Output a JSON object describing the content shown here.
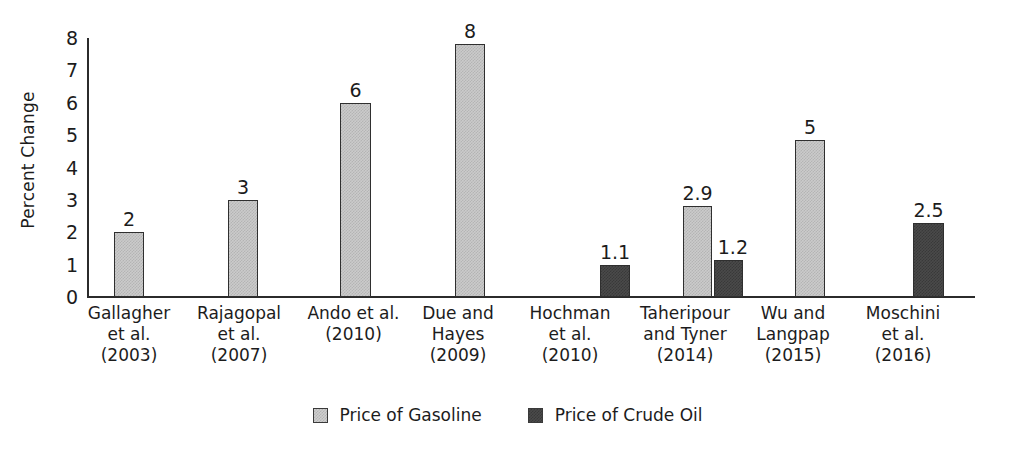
{
  "chart_data": {
    "type": "bar",
    "title": "",
    "xlabel": "",
    "ylabel": "Percent Change",
    "ylim": [
      0,
      8
    ],
    "yticks": [
      0,
      1,
      2,
      3,
      4,
      5,
      6,
      7,
      8
    ],
    "grid": false,
    "legend_position": "bottom-center",
    "categories": [
      "Gallagher et al. (2003)",
      "Rajagopal et al. (2007)",
      "Ando et al. (2010)",
      "Due and Hayes (2009)",
      "Hochman et al. (2010)",
      "Taheripour and Tyner (2014)",
      "Wu and Langpap (2015)",
      "Moschini et al. (2016)"
    ],
    "category_lines": [
      [
        "Gallagher",
        "et al.",
        "(2003)"
      ],
      [
        "Rajagopal",
        "et al.",
        "(2007)"
      ],
      [
        "Ando et al.",
        "(2010)"
      ],
      [
        "Due and",
        "Hayes",
        "(2009)"
      ],
      [
        "Hochman",
        "et al.",
        "(2010)"
      ],
      [
        "Taheripour",
        "and Tyner",
        "(2014)"
      ],
      [
        "Wu and",
        "Langpap",
        "(2015)"
      ],
      [
        "Moschini",
        "et al.",
        "(2016)"
      ]
    ],
    "series": [
      {
        "name": "Price of Gasoline",
        "color": "#cbcbcb",
        "values": [
          2,
          3,
          6,
          8,
          null,
          2.9,
          5,
          null
        ]
      },
      {
        "name": "Price of Crude Oil",
        "color": "#4a4a4a",
        "values": [
          null,
          null,
          null,
          null,
          1.1,
          1.2,
          null,
          2.5
        ]
      }
    ],
    "bars": [
      {
        "category_index": 0,
        "series": "Price of Gasoline",
        "value": 2,
        "label": "2",
        "x": 114,
        "width": 30,
        "label_offset": "center"
      },
      {
        "category_index": 1,
        "series": "Price of Gasoline",
        "value": 3,
        "label": "3",
        "x": 228,
        "width": 30,
        "label_offset": "center"
      },
      {
        "category_index": 2,
        "series": "Price of Gasoline",
        "value": 6,
        "label": "6",
        "x": 340,
        "width": 31,
        "label_offset": "center"
      },
      {
        "category_index": 3,
        "series": "Price of Gasoline",
        "value": 7.8,
        "label": "8",
        "x": 455,
        "width": 30,
        "label_offset": "center"
      },
      {
        "category_index": 4,
        "series": "Price of Crude Oil",
        "value": 1.0,
        "label": "1.1",
        "x": 600,
        "width": 30,
        "label_offset": "center"
      },
      {
        "category_index": 5,
        "series": "Price of Gasoline",
        "value": 2.8,
        "label": "2.9",
        "x": 683,
        "width": 29,
        "label_offset": "center"
      },
      {
        "category_index": 5,
        "series": "Price of Crude Oil",
        "value": 1.15,
        "label": "1.2",
        "x": 714,
        "width": 29,
        "label_offset": "right"
      },
      {
        "category_index": 6,
        "series": "Price of Gasoline",
        "value": 4.85,
        "label": "5",
        "x": 795,
        "width": 30,
        "label_offset": "center"
      },
      {
        "category_index": 7,
        "series": "Price of Crude Oil",
        "value": 2.3,
        "label": "2.5",
        "x": 913,
        "width": 31,
        "label_offset": "center"
      }
    ],
    "category_label_x": [
      69,
      179,
      291,
      399,
      510,
      619,
      733,
      843
    ],
    "category_label_width": [
      120,
      120,
      125,
      118,
      120,
      132,
      120,
      120
    ]
  },
  "legend": {
    "items": [
      {
        "label": "Price of Gasoline",
        "series_key": "gasoline"
      },
      {
        "label": "Price of Crude Oil",
        "series_key": "crude"
      }
    ]
  }
}
